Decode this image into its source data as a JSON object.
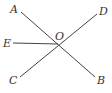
{
  "diagram": {
    "type": "geometry-lines",
    "line_color": "#444444",
    "label_color": "#333333",
    "points": {
      "A": {
        "label": "A",
        "x": 21,
        "y": 12,
        "lx": 10,
        "ly": 13
      },
      "B": {
        "label": "B",
        "x": 95,
        "y": 77,
        "lx": 97,
        "ly": 84
      },
      "C": {
        "label": "C",
        "x": 20,
        "y": 77,
        "lx": 9,
        "ly": 84
      },
      "D": {
        "label": "D",
        "x": 97,
        "y": 14,
        "lx": 99,
        "ly": 15
      },
      "E": {
        "label": "E",
        "x": 13,
        "y": 43,
        "lx": 3,
        "ly": 47
      },
      "O": {
        "label": "O",
        "x": 58,
        "y": 44,
        "lx": 55,
        "ly": 40
      }
    },
    "segments": [
      {
        "from": "A",
        "to": "B"
      },
      {
        "from": "C",
        "to": "D"
      },
      {
        "from": "E",
        "to": "O"
      }
    ]
  }
}
